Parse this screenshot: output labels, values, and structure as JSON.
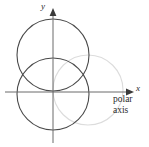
{
  "figure": {
    "title": "",
    "width": 149,
    "height": 147,
    "background": "#ffffff"
  },
  "labels": {
    "x_axis": "x",
    "y_axis": "y",
    "polar_line1": "polar",
    "polar_line2": "axis"
  },
  "colors": {
    "axis": "#6b6b6b",
    "curve_dark": "#4a4a4a",
    "curve_faint": "#dcdcdc",
    "text": "#2b2b2b"
  },
  "chart_data": {
    "type": "scatter",
    "title": "",
    "xlabel": "x",
    "ylabel": "y",
    "grid": false,
    "legend": null,
    "origin_px": [
      53,
      92
    ],
    "axes": {
      "x_axis": {
        "from_px": [
          5,
          92
        ],
        "to_px": [
          133,
          92
        ],
        "arrow": "right"
      },
      "y_axis": {
        "from_px": [
          53,
          143
        ],
        "to_px": [
          53,
          9
        ],
        "arrow": "up"
      }
    },
    "annotations": [
      {
        "text": "x",
        "at_px": [
          136,
          88
        ],
        "style": "italic"
      },
      {
        "text": "y",
        "at_px": [
          44,
          7
        ],
        "style": "italic"
      },
      {
        "text": "polar",
        "at_px": [
          113,
          99
        ]
      },
      {
        "text": "axis",
        "at_px": [
          113,
          110
        ]
      }
    ],
    "curves": [
      {
        "name": "upper-circle",
        "shape": "circle",
        "center_px": [
          53,
          55
        ],
        "radius_px": 36,
        "color": "#4a4a4a",
        "stroke_px": 1.1,
        "emphasis": "solid"
      },
      {
        "name": "lower-circle",
        "shape": "circle",
        "center_px": [
          53,
          94
        ],
        "radius_px": 36,
        "color": "#4a4a4a",
        "stroke_px": 1.1,
        "emphasis": "solid"
      },
      {
        "name": "polar-axis-circle",
        "shape": "circle",
        "center_px": [
          88,
          90
        ],
        "radius_px": 35,
        "color": "#dcdcdc",
        "stroke_px": 1.1,
        "emphasis": "faint"
      }
    ]
  }
}
